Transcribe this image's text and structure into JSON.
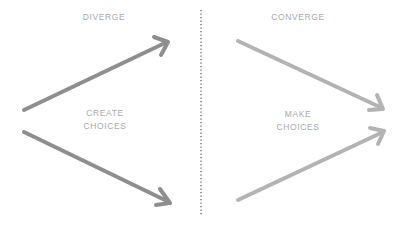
{
  "diagram": {
    "divider": {
      "style": "dotted",
      "color": "#6e6e6e",
      "x": 201,
      "y_start": 10,
      "y_end": 215
    },
    "left_phase": {
      "title": "DIVERGE",
      "center_label_line1": "CREATE",
      "center_label_line2": "CHOICES",
      "arrow_color": "#8e8e8e",
      "arrows": [
        {
          "name": "diverge-up",
          "from": [
            24,
            110
          ],
          "to": [
            168,
            42
          ]
        },
        {
          "name": "diverge-down",
          "from": [
            24,
            132
          ],
          "to": [
            170,
            203
          ]
        }
      ]
    },
    "right_phase": {
      "title": "CONVERGE",
      "center_label_line1": "MAKE",
      "center_label_line2": "CHOICES",
      "arrow_color": "#b3b3b3",
      "arrows": [
        {
          "name": "converge-down",
          "from": [
            238,
            41
          ],
          "to": [
            383,
            109
          ]
        },
        {
          "name": "converge-up",
          "from": [
            238,
            200
          ],
          "to": [
            384,
            131
          ]
        }
      ]
    },
    "label_color": "#a9a9a9"
  }
}
